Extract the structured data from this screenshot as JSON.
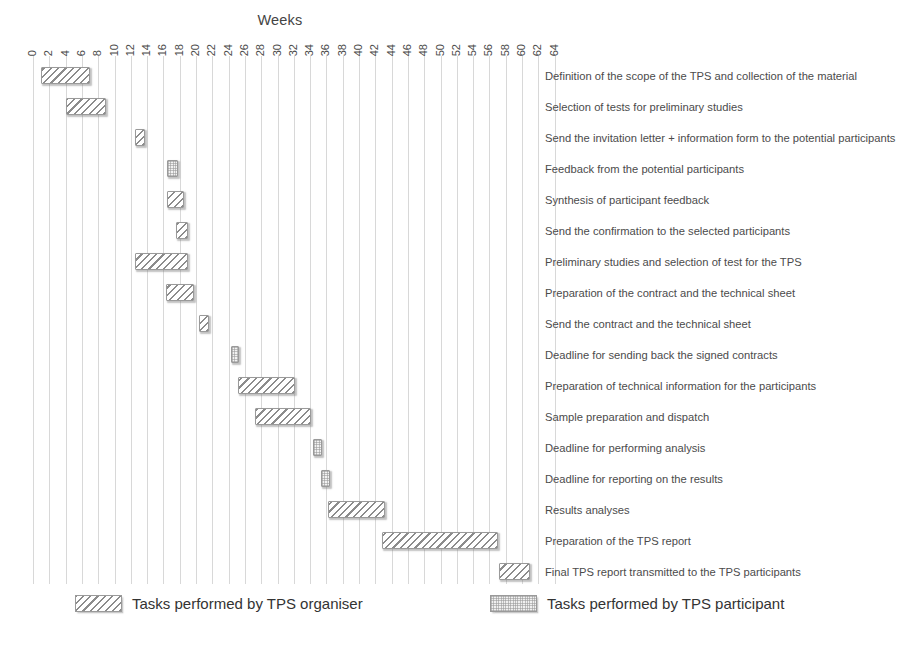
{
  "chart_data": {
    "type": "bar",
    "subtype": "gantt",
    "title": "Weeks",
    "xlabel": "Weeks",
    "ylabel": "",
    "xlim": [
      0,
      65
    ],
    "grid": true,
    "legend_position": "bottom",
    "x_tick_labels": [
      "0",
      "2",
      "4",
      "6",
      "8",
      "10",
      "12",
      "14",
      "16",
      "18",
      "20",
      "22",
      "24",
      "26",
      "28",
      "30",
      "32",
      "34",
      "36",
      "38",
      "40",
      "42",
      "44",
      "46",
      "48",
      "50",
      "52",
      "54",
      "56",
      "58",
      "60",
      "62",
      "64"
    ],
    "x_tick_values": [
      0,
      2,
      4,
      6,
      8,
      10,
      12,
      14,
      16,
      18,
      20,
      22,
      24,
      26,
      28,
      30,
      32,
      34,
      36,
      38,
      40,
      42,
      44,
      46,
      48,
      50,
      52,
      54,
      56,
      58,
      60,
      62,
      64
    ],
    "series": [
      {
        "name": "Tasks performed by TPS organiser",
        "key": "organiser",
        "pattern": "diagonal-hatch",
        "color": "#8c8c8c"
      },
      {
        "name": "Tasks performed by TPS participant",
        "key": "participant",
        "pattern": "dotted-fill",
        "color": "#bcbcbc"
      }
    ],
    "tasks": [
      {
        "label": "Definition of the scope of the TPS and collection of the material",
        "start": 1,
        "end": 7,
        "owner": "organiser"
      },
      {
        "label": "Selection of tests for preliminary studies",
        "start": 4,
        "end": 9,
        "owner": "organiser"
      },
      {
        "label": "Send the invitation letter + information form to the potential participants",
        "start": 12.5,
        "end": 13.8,
        "owner": "organiser"
      },
      {
        "label": "Feedback from the potential participants",
        "start": 16.5,
        "end": 17.8,
        "owner": "participant"
      },
      {
        "label": "Synthesis of participant feedback",
        "start": 16.5,
        "end": 18.5,
        "owner": "organiser"
      },
      {
        "label": "Send the confirmation to the selected participants",
        "start": 17.5,
        "end": 19,
        "owner": "organiser"
      },
      {
        "label": "Preliminary studies and selection of test for the TPS",
        "start": 12.5,
        "end": 19,
        "owner": "organiser"
      },
      {
        "label": "Preparation of the contract and the technical sheet",
        "start": 16.3,
        "end": 19.8,
        "owner": "organiser"
      },
      {
        "label": "Send the contract and the technical sheet",
        "start": 20.4,
        "end": 21.6,
        "owner": "organiser"
      },
      {
        "label": "Deadline for sending back the signed contracts",
        "start": 24.3,
        "end": 25.3,
        "owner": "participant"
      },
      {
        "label": "Preparation of technical information for the participants",
        "start": 25.2,
        "end": 32.2,
        "owner": "organiser"
      },
      {
        "label": "Sample preparation and dispatch",
        "start": 27.3,
        "end": 34.1,
        "owner": "organiser"
      },
      {
        "label": "Deadline for performing analysis",
        "start": 34.4,
        "end": 35.5,
        "owner": "participant"
      },
      {
        "label": "Deadline for reporting on the results",
        "start": 35.3,
        "end": 36.4,
        "owner": "participant"
      },
      {
        "label": "Results analyses",
        "start": 36.2,
        "end": 43.2,
        "owner": "organiser"
      },
      {
        "label": "Preparation of the TPS report",
        "start": 42.8,
        "end": 57,
        "owner": "organiser"
      },
      {
        "label": "Final TPS report transmitted to the TPS participants",
        "start": 57.2,
        "end": 61,
        "owner": "organiser"
      }
    ]
  },
  "legend": {
    "items": [
      {
        "label": "Tasks performed by TPS organiser",
        "key": "organiser"
      },
      {
        "label": "Tasks performed by TPS participant",
        "key": "participant"
      }
    ]
  }
}
